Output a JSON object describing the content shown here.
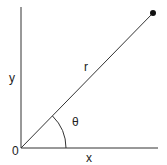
{
  "diagram": {
    "type": "polar-coordinates",
    "labels": {
      "y_axis": "y",
      "x_axis": "x",
      "radius": "r",
      "angle": "θ",
      "origin": "0"
    },
    "colors": {
      "line": "#333333",
      "text": "#222222",
      "point": "#111111"
    }
  }
}
